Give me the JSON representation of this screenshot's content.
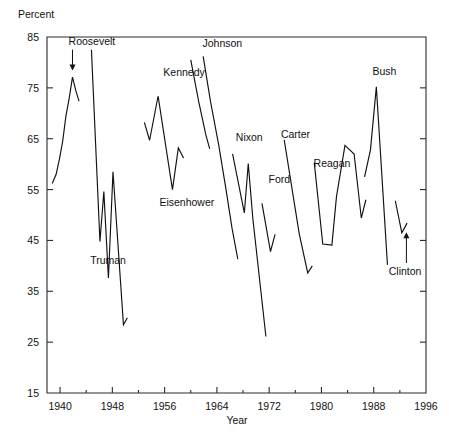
{
  "chart_data": {
    "type": "line",
    "title": "",
    "xlabel": "Year",
    "ylabel": "Percent",
    "xlim": [
      1938,
      1996
    ],
    "ylim": [
      15,
      85
    ],
    "grid": false,
    "legend": "none",
    "y_ticks": [
      15,
      25,
      35,
      45,
      55,
      65,
      75,
      85
    ],
    "x_ticks": [
      1940,
      1948,
      1956,
      1964,
      1972,
      1980,
      1988,
      1996
    ],
    "x_minor_ticks": [
      1944,
      1952,
      1960,
      1968,
      1976,
      1984,
      1992
    ],
    "annotations": [
      {
        "name": "Roosevelt",
        "label": "Roosevelt",
        "x": 1941.3,
        "y_text": 83.5,
        "arrow": "down",
        "target_x": 1941.9,
        "target_y": 78.4
      },
      {
        "name": "Truman",
        "label": "Truman",
        "x": 1944.6,
        "y_text": 40.3,
        "arrow": "none"
      },
      {
        "name": "Eisenhower",
        "label": "Eisenhower",
        "x": 1955.2,
        "y_text": 51.7,
        "arrow": "none"
      },
      {
        "name": "Kennedy",
        "label": "Kennedy",
        "x": 1955.8,
        "y_text": 77.3,
        "arrow": "none"
      },
      {
        "name": "Johnson",
        "label": "Johnson",
        "x": 1961.8,
        "y_text": 83.0,
        "arrow": "none"
      },
      {
        "name": "Nixon",
        "label": "Nixon",
        "x": 1966.9,
        "y_text": 64.5,
        "arrow": "none"
      },
      {
        "name": "Ford",
        "label": "Ford",
        "x": 1971.9,
        "y_text": 56.2,
        "arrow": "none"
      },
      {
        "name": "Carter",
        "label": "Carter",
        "x": 1973.8,
        "y_text": 65.1,
        "arrow": "none"
      },
      {
        "name": "Reagan",
        "label": "Reagan",
        "x": 1978.8,
        "y_text": 59.4,
        "arrow": "none"
      },
      {
        "name": "Bush",
        "label": "Bush",
        "x": 1987.8,
        "y_text": 77.6,
        "arrow": "none"
      },
      {
        "name": "Clinton",
        "label": "Clinton",
        "x": 1990.3,
        "y_text": 38.2,
        "arrow": "up",
        "target_x": 1993.0,
        "target_y": 46.6
      }
    ],
    "series": [
      {
        "name": "Roosevelt",
        "points": [
          [
            1938.8,
            56.2
          ],
          [
            1939.4,
            58.0
          ],
          [
            1939.9,
            61.0
          ],
          [
            1940.4,
            64.5
          ],
          [
            1940.9,
            69.5
          ],
          [
            1941.4,
            73.0
          ],
          [
            1941.9,
            77.1
          ],
          [
            1942.4,
            74.5
          ],
          [
            1942.9,
            72.4
          ]
        ]
      },
      {
        "name": "Truman",
        "points": [
          [
            1944.8,
            82.5
          ],
          [
            1946.1,
            44.8
          ],
          [
            1946.7,
            54.6
          ],
          [
            1947.4,
            37.6
          ],
          [
            1948.1,
            58.5
          ],
          [
            1949.7,
            28.4
          ],
          [
            1950.3,
            29.8
          ]
        ]
      },
      {
        "name": "Eisenhower",
        "points": [
          [
            1952.9,
            68.2
          ],
          [
            1953.7,
            64.7
          ],
          [
            1955.0,
            73.4
          ],
          [
            1957.2,
            55.0
          ],
          [
            1958.1,
            63.2
          ],
          [
            1958.9,
            61.2
          ]
        ]
      },
      {
        "name": "Kennedy",
        "points": [
          [
            1960.0,
            80.5
          ],
          [
            1961.2,
            72.4
          ],
          [
            1962.3,
            65.8
          ],
          [
            1962.9,
            63.0
          ]
        ]
      },
      {
        "name": "Johnson",
        "points": [
          [
            1961.9,
            81.2
          ],
          [
            1963.0,
            72.5
          ],
          [
            1964.3,
            63.6
          ],
          [
            1965.4,
            55.0
          ],
          [
            1966.3,
            47.5
          ],
          [
            1967.2,
            41.3
          ]
        ]
      },
      {
        "name": "Nixon",
        "points": [
          [
            1966.4,
            62.0
          ],
          [
            1968.2,
            50.4
          ],
          [
            1968.8,
            60.1
          ],
          [
            1969.5,
            49.3
          ],
          [
            1971.5,
            26.1
          ]
        ]
      },
      {
        "name": "Ford",
        "points": [
          [
            1970.9,
            52.3
          ],
          [
            1972.2,
            42.8
          ],
          [
            1972.9,
            46.2
          ]
        ]
      },
      {
        "name": "Carter",
        "points": [
          [
            1974.3,
            64.8
          ],
          [
            1976.6,
            46.3
          ],
          [
            1977.9,
            38.6
          ],
          [
            1978.6,
            40.0
          ]
        ]
      },
      {
        "name": "Reagan",
        "points": [
          [
            1978.9,
            60.3
          ],
          [
            1980.2,
            44.3
          ],
          [
            1981.6,
            44.1
          ],
          [
            1982.3,
            53.6
          ],
          [
            1983.6,
            63.7
          ],
          [
            1985.0,
            62.0
          ],
          [
            1986.1,
            49.4
          ],
          [
            1986.8,
            53.0
          ]
        ]
      },
      {
        "name": "Bush",
        "points": [
          [
            1986.6,
            57.5
          ],
          [
            1987.5,
            62.8
          ],
          [
            1988.4,
            75.2
          ],
          [
            1990.1,
            40.2
          ]
        ]
      },
      {
        "name": "Clinton",
        "points": [
          [
            1991.3,
            52.8
          ],
          [
            1992.3,
            46.5
          ],
          [
            1993.1,
            48.4
          ]
        ]
      }
    ]
  },
  "axes": {
    "y_title": "Percent",
    "x_title": "Year"
  }
}
